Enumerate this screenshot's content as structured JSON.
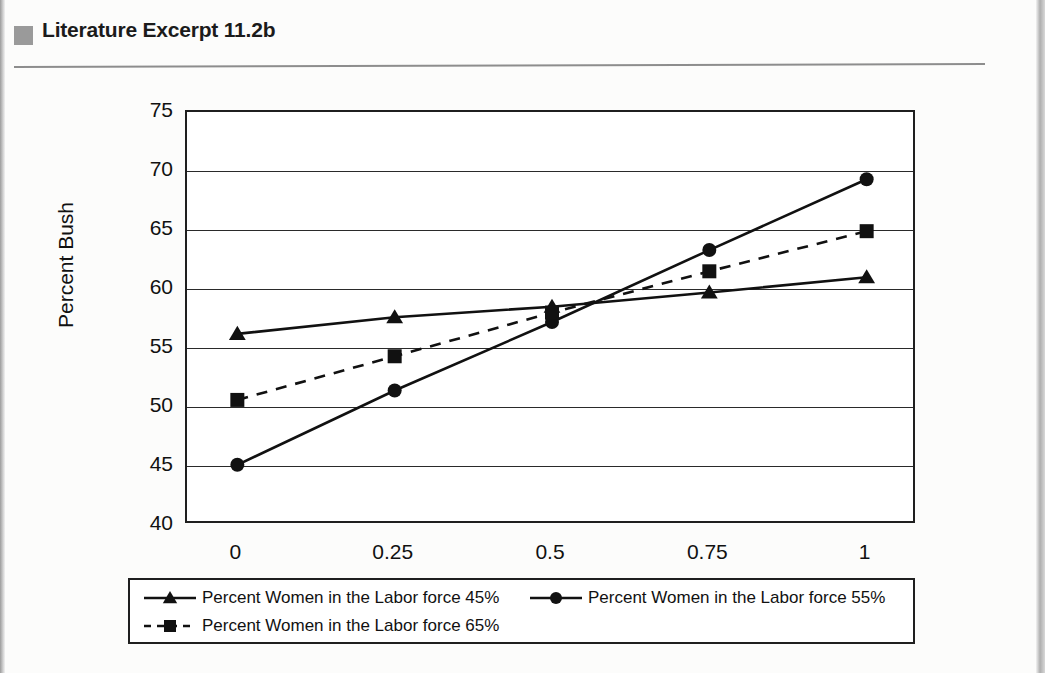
{
  "header": {
    "title": "Literature Excerpt 11.2b",
    "bullet_icon": "gray-square-bullet",
    "rule_color": "#8d8d8d"
  },
  "chart_data": {
    "type": "line",
    "title": "",
    "xlabel": "Occupational Sex Segregation",
    "ylabel": "Percent Bush",
    "x": [
      0,
      0.25,
      0.5,
      0.75,
      1
    ],
    "xtick_labels": [
      "0",
      "0.25",
      "0.5",
      "0.75",
      "1"
    ],
    "ytick_labels": [
      "40",
      "45",
      "50",
      "55",
      "60",
      "65",
      "70",
      "75"
    ],
    "yticks": [
      40,
      45,
      50,
      55,
      60,
      65,
      70,
      75
    ],
    "xlim": [
      -0.08,
      1.08
    ],
    "ylim": [
      40,
      75
    ],
    "grid": "horizontal",
    "legend_position": "below-plot",
    "series": [
      {
        "name": "Percent Women in the Labor force 45%",
        "marker": "triangle",
        "line_style": "solid",
        "color": "#111111",
        "values": [
          56.2,
          57.6,
          58.5,
          59.7,
          61.0
        ]
      },
      {
        "name": "Percent Women in the Labor force 55%",
        "marker": "circle",
        "line_style": "solid",
        "color": "#111111",
        "values": [
          45.1,
          51.4,
          57.2,
          63.3,
          69.3
        ]
      },
      {
        "name": "Percent Women in the Labor force 65%",
        "marker": "square",
        "line_style": "dashed",
        "color": "#111111",
        "values": [
          50.6,
          54.3,
          58.0,
          61.5,
          64.9
        ]
      }
    ]
  },
  "legend": {
    "entries": [
      {
        "label": "Percent Women in the Labor force 45%",
        "marker": "triangle",
        "line_style": "solid"
      },
      {
        "label": "Percent Women in the Labor force 55%",
        "marker": "circle",
        "line_style": "solid"
      },
      {
        "label": "Percent Women in the Labor force 65%",
        "marker": "square",
        "line_style": "dashed"
      }
    ]
  }
}
